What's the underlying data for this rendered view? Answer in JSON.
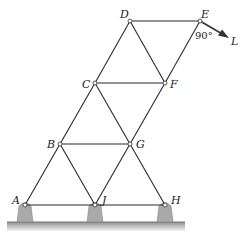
{
  "diagram": {
    "joints": [
      {
        "id": "A",
        "label": "A"
      },
      {
        "id": "B",
        "label": "B"
      },
      {
        "id": "C",
        "label": "C"
      },
      {
        "id": "D",
        "label": "D"
      },
      {
        "id": "E",
        "label": "E"
      },
      {
        "id": "F",
        "label": "F"
      },
      {
        "id": "G",
        "label": "G"
      },
      {
        "id": "H",
        "label": "H"
      },
      {
        "id": "J",
        "label": "J"
      }
    ],
    "load": {
      "label": "L",
      "angle_label": "90°"
    },
    "colors": {
      "member": "#2a2a2a",
      "support": "#a8a8a8",
      "ground": "#9a9a9a"
    }
  }
}
